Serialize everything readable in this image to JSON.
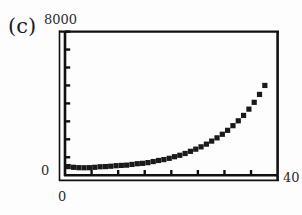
{
  "panel": {
    "label": "(c)"
  },
  "axes": {
    "y_top_label": "8000",
    "y_bottom_label": "0",
    "x_left_label": "0",
    "x_right_label": "40"
  },
  "chart_data": {
    "type": "scatter",
    "title": "(c)",
    "xlabel": "",
    "ylabel": "",
    "xlim": [
      0,
      40
    ],
    "ylim": [
      0,
      8000
    ],
    "grid": false,
    "legend": null,
    "xticks": [
      0,
      5,
      10,
      15,
      20,
      25,
      30,
      35,
      40
    ],
    "xticklabels": [
      "0",
      "",
      "",
      "",
      "",
      "",
      "",
      "",
      "40"
    ],
    "yticks": [
      0,
      1000,
      2000,
      3000,
      4000,
      5000,
      6000,
      7000,
      8000
    ],
    "yticklabels": [
      "0",
      "",
      "",
      "",
      "",
      "",
      "",
      "",
      "8000"
    ],
    "marker": "square",
    "marker_color": "#1a1a1a",
    "marker_size": 2.6,
    "series": [
      {
        "name": "data",
        "x": [
          0.6,
          1.6,
          2.6,
          3.6,
          4.6,
          5.6,
          6.6,
          7.6,
          8.6,
          9.6,
          10.6,
          11.6,
          12.6,
          13.6,
          14.6,
          15.6,
          16.6,
          17.6,
          18.6,
          19.6,
          20.6,
          21.6,
          22.6,
          23.6,
          24.6,
          25.6,
          26.6,
          27.6,
          28.6,
          29.6,
          30.6,
          31.6,
          32.6,
          33.6,
          34.6,
          35.6,
          36.6,
          37.6
        ],
        "y": [
          480,
          440,
          420,
          415,
          420,
          440,
          470,
          480,
          500,
          530,
          545,
          560,
          600,
          640,
          660,
          700,
          760,
          820,
          870,
          940,
          1030,
          1110,
          1210,
          1330,
          1450,
          1580,
          1730,
          1900,
          2080,
          2280,
          2500,
          2760,
          3030,
          3330,
          3680,
          4060,
          4500,
          5000
        ]
      }
    ]
  }
}
